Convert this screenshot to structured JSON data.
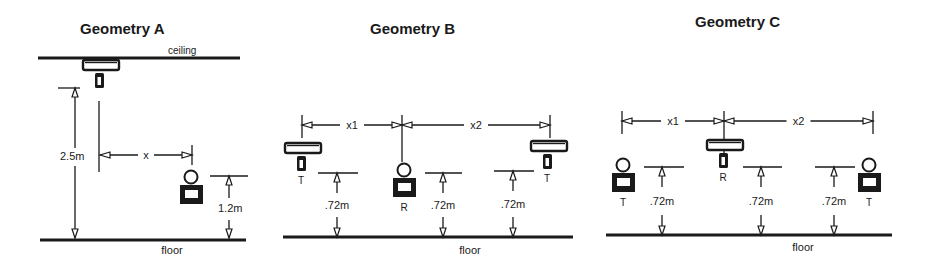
{
  "panels": [
    {
      "id": "A",
      "title": "Geometry A",
      "title_pos": [
        80,
        34
      ],
      "ceiling": {
        "label": "ceiling",
        "x1": 38,
        "x2": 240,
        "y": 58,
        "label_pos": [
          168,
          54
        ]
      },
      "floor": {
        "label": "floor",
        "x1": 40,
        "x2": 246,
        "y": 240,
        "label_pos": [
          172,
          254
        ]
      },
      "transmitter": {
        "type": "ceiling",
        "x": 83,
        "y": 60,
        "label": ""
      },
      "receiver": {
        "type": "floor-unit",
        "x": 180,
        "y": 170,
        "label": ""
      },
      "dims": [
        {
          "label": "2.5m",
          "kind": "vertical",
          "x": 75,
          "y1": 88,
          "y2": 238,
          "tick_x1": 58,
          "tick_x2": 80,
          "label_pos": [
            60,
            160
          ]
        },
        {
          "label": "x",
          "kind": "horizontal",
          "y": 155,
          "x1": 100,
          "x2": 192,
          "label_pos": [
            146,
            159
          ]
        },
        {
          "label": "1.2m",
          "kind": "vertical",
          "x": 229,
          "y1": 176,
          "y2": 238,
          "tick_x1": 210,
          "tick_x2": 248,
          "label_pos": [
            218,
            212
          ]
        }
      ]
    },
    {
      "id": "B",
      "title": "Geometry B",
      "title_pos": [
        370,
        34
      ],
      "floor": {
        "label": "floor",
        "x1": 283,
        "x2": 573,
        "y": 237,
        "label_pos": [
          470,
          254
        ]
      },
      "units": [
        {
          "role": "T",
          "type": "ceiling",
          "x": 285,
          "y": 143
        },
        {
          "role": "R",
          "type": "floor-unit",
          "x": 393,
          "y": 163
        },
        {
          "role": "T",
          "type": "ceiling",
          "x": 531,
          "y": 141
        }
      ],
      "spans": [
        {
          "label": "x1",
          "x1": 302,
          "x2": 402,
          "y": 125
        },
        {
          "label": "x2",
          "x1": 402,
          "x2": 550,
          "y": 125
        }
      ],
      "heights": [
        {
          "label": ".72m",
          "x": 337,
          "y_top": 173,
          "y_bot": 237,
          "tick_x1": 318,
          "tick_x2": 358
        },
        {
          "label": ".72m",
          "x": 443,
          "y_top": 173,
          "y_bot": 237,
          "tick_x1": 425,
          "tick_x2": 462
        },
        {
          "label": ".72m",
          "x": 513,
          "y_top": 171,
          "y_bot": 237,
          "tick_x1": 494,
          "tick_x2": 534
        }
      ]
    },
    {
      "id": "C",
      "title": "Geometry C",
      "title_pos": [
        695,
        27
      ],
      "floor": {
        "label": "floor",
        "x1": 606,
        "x2": 892,
        "y": 235,
        "label_pos": [
          803,
          251
        ]
      },
      "units": [
        {
          "role": "T",
          "type": "floor-unit",
          "x": 612,
          "y": 158
        },
        {
          "role": "R",
          "type": "ceiling",
          "x": 707,
          "y": 140
        },
        {
          "role": "T",
          "type": "floor-unit",
          "x": 858,
          "y": 158
        }
      ],
      "spans": [
        {
          "label": "x1",
          "x1": 622,
          "x2": 724,
          "y": 121
        },
        {
          "label": "x2",
          "x1": 724,
          "x2": 873,
          "y": 121
        }
      ],
      "heights": [
        {
          "label": ".72m",
          "x": 662,
          "y_top": 167,
          "y_bot": 235,
          "tick_x1": 644,
          "tick_x2": 684
        },
        {
          "label": ".72m",
          "x": 761,
          "y_top": 167,
          "y_bot": 235,
          "tick_x1": 743,
          "tick_x2": 782
        },
        {
          "label": ".72m",
          "x": 834,
          "y_top": 167,
          "y_bot": 235,
          "tick_x1": 815,
          "tick_x2": 855
        }
      ]
    }
  ]
}
